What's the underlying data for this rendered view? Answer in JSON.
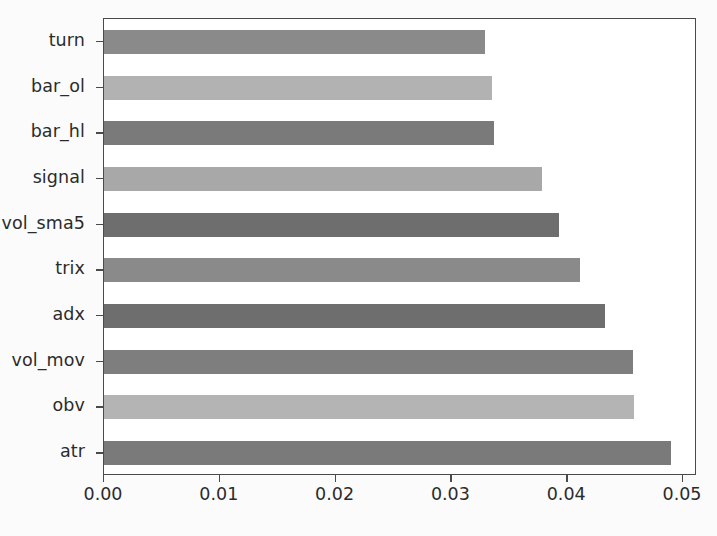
{
  "chart_data": {
    "type": "bar",
    "orientation": "horizontal",
    "title": "",
    "xlabel": "",
    "ylabel": "",
    "xlim": [
      0.0,
      0.05
    ],
    "ylim": [
      -0.5,
      9.5
    ],
    "grid": false,
    "legend": null,
    "xticks": [
      "0.00",
      "0.01",
      "0.02",
      "0.03",
      "0.04",
      "0.05"
    ],
    "xtick_values": [
      0.0,
      0.01,
      0.02,
      0.03,
      0.04,
      0.05
    ],
    "categories": [
      "turn",
      "bar_ol",
      "bar_hl",
      "signal",
      "vol_sma5",
      "trix",
      "adx",
      "vol_mov",
      "obv",
      "atr"
    ],
    "values": [
      0.0329,
      0.0335,
      0.0337,
      0.0378,
      0.0393,
      0.0411,
      0.0433,
      0.0457,
      0.0458,
      0.049
    ],
    "bar_colors": [
      "#8a8a8a",
      "#b2b2b2",
      "#7a7a7a",
      "#a8a8a8",
      "#6e6e6e",
      "#8a8a8a",
      "#6e6e6e",
      "#7e7e7e",
      "#b4b4b4",
      "#7a7a7a"
    ],
    "axis_color": "#4a4a4a",
    "background_color": "#ffffff",
    "figure_background_color": "#fbfbfb",
    "text_color": "#2b2b2b"
  }
}
